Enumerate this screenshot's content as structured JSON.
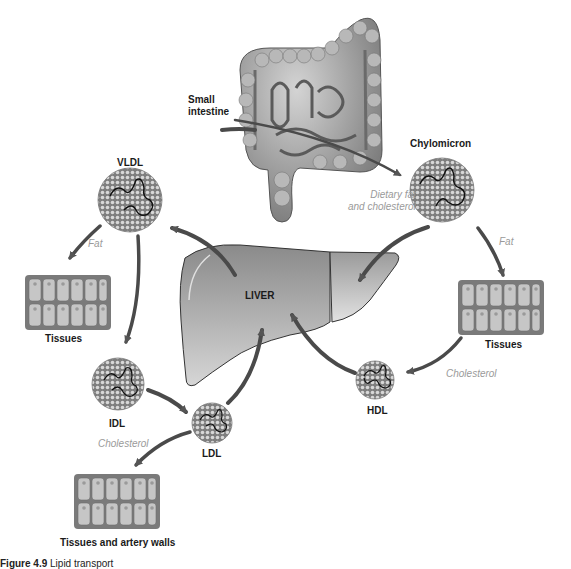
{
  "figure": {
    "title": "Lipid transport",
    "caption_number": "Figure 4.9",
    "caption_text": "Lipid transport"
  },
  "organs": {
    "small_intestine": {
      "label_line1": "Small",
      "label_line2": "intestine"
    },
    "liver": {
      "label": "LIVER"
    }
  },
  "lipoproteins": {
    "chylomicron": {
      "label": "Chylomicron"
    },
    "vldl": {
      "label": "VLDL"
    },
    "idl": {
      "label": "IDL"
    },
    "ldl": {
      "label": "LDL"
    },
    "hdl": {
      "label": "HDL"
    }
  },
  "tissues": {
    "left": {
      "label": "Tissues"
    },
    "right": {
      "label": "Tissues"
    },
    "bottom": {
      "label": "Tissues and artery walls"
    }
  },
  "flows": {
    "dietary_line1": "Dietary fat",
    "dietary_line2": "and cholesterol",
    "vldl_fat": "Fat",
    "chylo_fat": "Fat",
    "ldl_cholesterol": "Cholesterol",
    "hdl_cholesterol": "Cholesterol"
  },
  "colors": {
    "arrow": "#4a4a4a",
    "particle_fill": "#8c8c8c",
    "liver_top": "#8f8f8f",
    "liver_bottom": "#d0d0d0",
    "tissue_frame": "#7a7a7a",
    "tissue_cell": "#c4c4c4",
    "italic_text": "#9a9a9a"
  }
}
